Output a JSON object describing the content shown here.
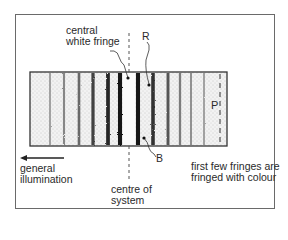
{
  "diagram": {
    "labels": {
      "central_white_fringe_line1": "central",
      "central_white_fringe_line2": "white fringe",
      "R": "R",
      "B": "B",
      "P": "P",
      "general_illumination_line1": "general",
      "general_illumination_line2": "illumination",
      "centre_line1": "centre of",
      "centre_line2": "system",
      "note_line1": "first few fringes are",
      "note_line2": "fringed with colour"
    },
    "fringes": [
      {
        "x": 50,
        "darkness": 0.25
      },
      {
        "x": 64,
        "darkness": 0.35
      },
      {
        "x": 79,
        "darkness": 0.5
      },
      {
        "x": 93,
        "darkness": 0.7
      },
      {
        "x": 108,
        "darkness": 0.85
      },
      {
        "x": 120,
        "darkness": 0.95
      },
      {
        "x": 138,
        "darkness": 0.95
      },
      {
        "x": 153,
        "darkness": 0.8
      },
      {
        "x": 168,
        "darkness": 0.6
      },
      {
        "x": 180,
        "darkness": 0.4
      },
      {
        "x": 191,
        "darkness": 0.3
      },
      {
        "x": 204,
        "darkness": 0.25
      }
    ],
    "colors": {
      "frame": "#6a6a6a",
      "ink": "#222222",
      "background_stipple": "#e6e6e6"
    }
  }
}
